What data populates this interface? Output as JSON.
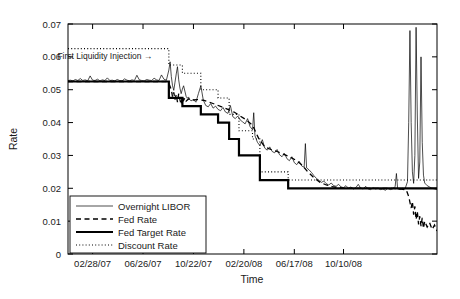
{
  "figure": {
    "background": "#ffffff",
    "line_color": "#000000"
  },
  "chart_data": {
    "type": "line",
    "title": "",
    "xlabel": "Time",
    "ylabel": "Rate",
    "xlim": [
      0,
      600
    ],
    "ylim": [
      0,
      0.07
    ],
    "grid": false,
    "legend_position": "lower left",
    "xtick_labels": [
      "02/28/07",
      "06/26/07",
      "10/22/07",
      "02/20/08",
      "06/17/08",
      "10/10/08"
    ],
    "xtick_positions": [
      40,
      122,
      204,
      286,
      368,
      448
    ],
    "ytick_labels": [
      "0",
      "0.01",
      "0.02",
      "0.03",
      "0.04",
      "0.05",
      "0.06",
      "0.07"
    ],
    "ytick_values": [
      0,
      0.01,
      0.02,
      0.03,
      0.04,
      0.05,
      0.06,
      0.07
    ],
    "annotations": [
      {
        "text": "First Liquidity Injection →",
        "x": 60,
        "y": 0.0595
      }
    ],
    "series": [
      {
        "name": "Overnight LIBOR",
        "style": "solid-thin",
        "linewidth": 0.7,
        "points": [
          [
            0,
            0.0528
          ],
          [
            4,
            0.0529
          ],
          [
            8,
            0.0527
          ],
          [
            12,
            0.0531
          ],
          [
            16,
            0.0528
          ],
          [
            20,
            0.0534
          ],
          [
            24,
            0.0528
          ],
          [
            28,
            0.053
          ],
          [
            32,
            0.0527
          ],
          [
            36,
            0.0542
          ],
          [
            40,
            0.0529
          ],
          [
            44,
            0.0528
          ],
          [
            48,
            0.0532
          ],
          [
            52,
            0.0527
          ],
          [
            56,
            0.053
          ],
          [
            60,
            0.0528
          ],
          [
            64,
            0.0536
          ],
          [
            68,
            0.0528
          ],
          [
            72,
            0.0529
          ],
          [
            76,
            0.0527
          ],
          [
            80,
            0.0531
          ],
          [
            84,
            0.0528
          ],
          [
            88,
            0.0527
          ],
          [
            92,
            0.0533
          ],
          [
            96,
            0.0529
          ],
          [
            100,
            0.0527
          ],
          [
            104,
            0.053
          ],
          [
            108,
            0.0528
          ],
          [
            112,
            0.0544
          ],
          [
            116,
            0.053
          ],
          [
            120,
            0.0528
          ],
          [
            124,
            0.0527
          ],
          [
            128,
            0.0531
          ],
          [
            132,
            0.0529
          ],
          [
            136,
            0.0528
          ],
          [
            140,
            0.0535
          ],
          [
            144,
            0.053
          ],
          [
            148,
            0.0528
          ],
          [
            152,
            0.0545
          ],
          [
            156,
            0.0532
          ],
          [
            160,
            0.0529
          ],
          [
            164,
            0.056
          ],
          [
            166,
            0.0585
          ],
          [
            168,
            0.054
          ],
          [
            170,
            0.0512
          ],
          [
            172,
            0.0498
          ],
          [
            174,
            0.0523
          ],
          [
            176,
            0.0548
          ],
          [
            178,
            0.057
          ],
          [
            180,
            0.053
          ],
          [
            182,
            0.0505
          ],
          [
            184,
            0.0488
          ],
          [
            186,
            0.0502
          ],
          [
            188,
            0.0512
          ],
          [
            190,
            0.0496
          ],
          [
            192,
            0.048
          ],
          [
            194,
            0.0474
          ],
          [
            196,
            0.0478
          ],
          [
            198,
            0.047
          ],
          [
            200,
            0.0466
          ],
          [
            204,
            0.047
          ],
          [
            208,
            0.0462
          ],
          [
            212,
            0.0488
          ],
          [
            216,
            0.0512
          ],
          [
            220,
            0.0468
          ],
          [
            224,
            0.0452
          ],
          [
            228,
            0.0448
          ],
          [
            232,
            0.0458
          ],
          [
            236,
            0.0444
          ],
          [
            240,
            0.045
          ],
          [
            244,
            0.044
          ],
          [
            248,
            0.0436
          ],
          [
            252,
            0.0446
          ],
          [
            256,
            0.0432
          ],
          [
            260,
            0.0428
          ],
          [
            264,
            0.0452
          ],
          [
            268,
            0.0418
          ],
          [
            272,
            0.0412
          ],
          [
            276,
            0.042
          ],
          [
            280,
            0.0408
          ],
          [
            284,
            0.0402
          ],
          [
            288,
            0.0396
          ],
          [
            292,
            0.0412
          ],
          [
            296,
            0.0388
          ],
          [
            300,
            0.0378
          ],
          [
            302,
            0.043
          ],
          [
            304,
            0.036
          ],
          [
            308,
            0.034
          ],
          [
            312,
            0.033
          ],
          [
            316,
            0.0348
          ],
          [
            320,
            0.0322
          ],
          [
            324,
            0.0316
          ],
          [
            328,
            0.0326
          ],
          [
            332,
            0.0312
          ],
          [
            336,
            0.0308
          ],
          [
            340,
            0.0318
          ],
          [
            344,
            0.0302
          ],
          [
            348,
            0.0296
          ],
          [
            352,
            0.0306
          ],
          [
            356,
            0.029
          ],
          [
            360,
            0.0284
          ],
          [
            364,
            0.0296
          ],
          [
            368,
            0.0278
          ],
          [
            372,
            0.0272
          ],
          [
            376,
            0.0282
          ],
          [
            380,
            0.0268
          ],
          [
            384,
            0.0264
          ],
          [
            386,
            0.0336
          ],
          [
            388,
            0.0262
          ],
          [
            392,
            0.0256
          ],
          [
            396,
            0.0248
          ],
          [
            400,
            0.0238
          ],
          [
            404,
            0.023
          ],
          [
            408,
            0.0224
          ],
          [
            412,
            0.0218
          ],
          [
            416,
            0.0222
          ],
          [
            420,
            0.0214
          ],
          [
            424,
            0.021
          ],
          [
            428,
            0.0216
          ],
          [
            432,
            0.0208
          ],
          [
            436,
            0.0206
          ],
          [
            440,
            0.0212
          ],
          [
            444,
            0.0204
          ],
          [
            448,
            0.0202
          ],
          [
            452,
            0.0208
          ],
          [
            456,
            0.02
          ],
          [
            460,
            0.0204
          ],
          [
            464,
            0.0198
          ],
          [
            468,
            0.0202
          ],
          [
            472,
            0.0212
          ],
          [
            476,
            0.02
          ],
          [
            480,
            0.0198
          ],
          [
            484,
            0.0206
          ],
          [
            488,
            0.0198
          ],
          [
            492,
            0.0196
          ],
          [
            496,
            0.0202
          ],
          [
            500,
            0.0198
          ],
          [
            504,
            0.02
          ],
          [
            508,
            0.0196
          ],
          [
            512,
            0.0198
          ],
          [
            516,
            0.0194
          ],
          [
            520,
            0.02
          ],
          [
            524,
            0.0196
          ],
          [
            528,
            0.0198
          ],
          [
            532,
            0.0206
          ],
          [
            534,
            0.0245
          ],
          [
            536,
            0.0198
          ],
          [
            540,
            0.0196
          ],
          [
            544,
            0.02
          ],
          [
            548,
            0.0198
          ],
          [
            552,
            0.022
          ],
          [
            554,
            0.04
          ],
          [
            556,
            0.068
          ],
          [
            558,
            0.04
          ],
          [
            560,
            0.025
          ],
          [
            562,
            0.0215
          ],
          [
            564,
            0.03
          ],
          [
            566,
            0.069
          ],
          [
            568,
            0.042
          ],
          [
            570,
            0.023
          ],
          [
            572,
            0.028
          ],
          [
            574,
            0.06
          ],
          [
            576,
            0.034
          ],
          [
            578,
            0.024
          ],
          [
            580,
            0.0216
          ],
          [
            584,
            0.0208
          ],
          [
            588,
            0.0204
          ],
          [
            592,
            0.02
          ],
          [
            596,
            0.0198
          ],
          [
            600,
            0.0196
          ]
        ]
      },
      {
        "name": "Fed Rate",
        "style": "dashed",
        "linewidth": 1.3,
        "points": [
          [
            0,
            0.0525
          ],
          [
            20,
            0.0525
          ],
          [
            40,
            0.0525
          ],
          [
            60,
            0.0525
          ],
          [
            80,
            0.0525
          ],
          [
            100,
            0.0525
          ],
          [
            120,
            0.0525
          ],
          [
            140,
            0.0525
          ],
          [
            160,
            0.0525
          ],
          [
            164,
            0.052
          ],
          [
            168,
            0.05
          ],
          [
            170,
            0.0478
          ],
          [
            172,
            0.0492
          ],
          [
            174,
            0.047
          ],
          [
            176,
            0.0485
          ],
          [
            178,
            0.0462
          ],
          [
            180,
            0.0488
          ],
          [
            182,
            0.047
          ],
          [
            184,
            0.0455
          ],
          [
            186,
            0.048
          ],
          [
            188,
            0.0468
          ],
          [
            190,
            0.0475
          ],
          [
            192,
            0.0465
          ],
          [
            196,
            0.0472
          ],
          [
            200,
            0.0468
          ],
          [
            210,
            0.047
          ],
          [
            220,
            0.0468
          ],
          [
            230,
            0.0462
          ],
          [
            240,
            0.0455
          ],
          [
            250,
            0.0448
          ],
          [
            260,
            0.044
          ],
          [
            270,
            0.0432
          ],
          [
            280,
            0.042
          ],
          [
            290,
            0.0408
          ],
          [
            300,
            0.0392
          ],
          [
            310,
            0.0352
          ],
          [
            320,
            0.0326
          ],
          [
            330,
            0.0318
          ],
          [
            340,
            0.0312
          ],
          [
            350,
            0.0304
          ],
          [
            360,
            0.0296
          ],
          [
            370,
            0.0286
          ],
          [
            380,
            0.0272
          ],
          [
            390,
            0.025
          ],
          [
            400,
            0.0232
          ],
          [
            410,
            0.0218
          ],
          [
            420,
            0.021
          ],
          [
            430,
            0.0205
          ],
          [
            440,
            0.0202
          ],
          [
            450,
            0.02
          ],
          [
            460,
            0.02
          ],
          [
            470,
            0.02
          ],
          [
            480,
            0.02
          ],
          [
            490,
            0.02
          ],
          [
            500,
            0.02
          ],
          [
            510,
            0.02
          ],
          [
            520,
            0.02
          ],
          [
            530,
            0.02
          ],
          [
            540,
            0.0198
          ],
          [
            550,
            0.0195
          ],
          [
            554,
            0.0175
          ],
          [
            558,
            0.014
          ],
          [
            560,
            0.016
          ],
          [
            562,
            0.012
          ],
          [
            564,
            0.0145
          ],
          [
            566,
            0.0105
          ],
          [
            568,
            0.013
          ],
          [
            570,
            0.009
          ],
          [
            572,
            0.0115
          ],
          [
            574,
            0.0085
          ],
          [
            576,
            0.011
          ],
          [
            578,
            0.0078
          ],
          [
            580,
            0.01
          ],
          [
            584,
            0.0082
          ],
          [
            588,
            0.0095
          ],
          [
            592,
            0.0075
          ],
          [
            596,
            0.0088
          ],
          [
            600,
            0.007
          ]
        ]
      },
      {
        "name": "Fed Target Rate",
        "style": "solid-thick",
        "linewidth": 2.2,
        "points": [
          [
            0,
            0.0525
          ],
          [
            164,
            0.0525
          ],
          [
            164,
            0.0475
          ],
          [
            186,
            0.0475
          ],
          [
            186,
            0.045
          ],
          [
            216,
            0.045
          ],
          [
            216,
            0.0425
          ],
          [
            244,
            0.0425
          ],
          [
            244,
            0.04
          ],
          [
            262,
            0.04
          ],
          [
            262,
            0.035
          ],
          [
            278,
            0.035
          ],
          [
            278,
            0.03
          ],
          [
            300,
            0.03
          ],
          [
            300,
            0.03
          ],
          [
            312,
            0.03
          ],
          [
            312,
            0.0225
          ],
          [
            358,
            0.0225
          ],
          [
            358,
            0.02
          ],
          [
            550,
            0.02
          ],
          [
            550,
            0.02
          ],
          [
            600,
            0.02
          ]
        ]
      },
      {
        "name": "Discount Rate",
        "style": "dotted",
        "linewidth": 1.1,
        "points": [
          [
            0,
            0.0625
          ],
          [
            164,
            0.0625
          ],
          [
            164,
            0.0575
          ],
          [
            186,
            0.0575
          ],
          [
            186,
            0.055
          ],
          [
            216,
            0.055
          ],
          [
            216,
            0.05
          ],
          [
            244,
            0.05
          ],
          [
            244,
            0.0475
          ],
          [
            262,
            0.0475
          ],
          [
            262,
            0.0425
          ],
          [
            278,
            0.0425
          ],
          [
            278,
            0.0375
          ],
          [
            300,
            0.0375
          ],
          [
            300,
            0.035
          ],
          [
            312,
            0.035
          ],
          [
            312,
            0.025
          ],
          [
            358,
            0.025
          ],
          [
            358,
            0.0225
          ],
          [
            550,
            0.0225
          ],
          [
            550,
            0.0225
          ],
          [
            600,
            0.0225
          ]
        ]
      }
    ]
  },
  "legend": {
    "entries": [
      {
        "label": "Overnight LIBOR",
        "style": "solid-thin"
      },
      {
        "label": "Fed Rate",
        "style": "dashed"
      },
      {
        "label": "Fed Target Rate",
        "style": "solid-thick"
      },
      {
        "label": "Discount Rate",
        "style": "dotted"
      }
    ]
  }
}
